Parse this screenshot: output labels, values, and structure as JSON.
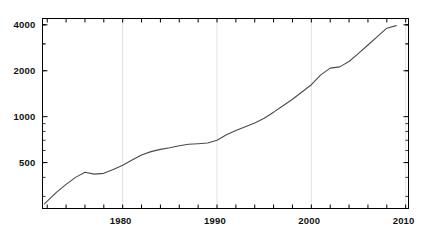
{
  "chart_data": {
    "type": "line",
    "title": "",
    "xlabel": "",
    "ylabel": "",
    "scale": {
      "x": "linear",
      "y": "log"
    },
    "xlim": [
      1971.5,
      2010.3
    ],
    "ylim": [
      250,
      4400
    ],
    "grid": "vertical gridlines at decade ticks",
    "legend": "none",
    "yticks": [
      500,
      1000,
      2000,
      4000
    ],
    "ytick_labels": [
      "500",
      "1000",
      "2000",
      "4000"
    ],
    "xticks": [
      1980,
      1990,
      2000,
      2010
    ],
    "xtick_labels": [
      "1980",
      "1990",
      "2000",
      "2010"
    ],
    "x_minor_tick_interval": 2,
    "series": [
      {
        "name": "series-1",
        "color": "#4a4a4a",
        "x": [
          1971.7,
          1973,
          1974,
          1975,
          1976,
          1977,
          1978,
          1979,
          1980,
          1981,
          1982,
          1983,
          1984,
          1985,
          1986,
          1987,
          1988,
          1989,
          1990,
          1991,
          1992,
          1993,
          1994,
          1995,
          1996,
          1997,
          1998,
          1999,
          2000,
          2001,
          2002,
          2003,
          2004,
          2005,
          2006,
          2007,
          2008,
          2009
        ],
        "values": [
          268,
          320,
          360,
          400,
          432,
          420,
          425,
          450,
          480,
          520,
          560,
          590,
          610,
          625,
          645,
          660,
          665,
          672,
          700,
          760,
          810,
          860,
          910,
          975,
          1070,
          1180,
          1300,
          1450,
          1620,
          1880,
          2080,
          2120,
          2300,
          2600,
          2950,
          3350,
          3800,
          3950
        ]
      }
    ],
    "annotations": [
      {
        "text": "local peak then dip",
        "x": 1976
      },
      {
        "text": "plateau after 2000",
        "x": 2002
      },
      {
        "text": "peak then decline",
        "x": 2008
      }
    ]
  },
  "axes": {
    "frame_color": "#000000",
    "gridline_color": "#e2e2e2"
  }
}
